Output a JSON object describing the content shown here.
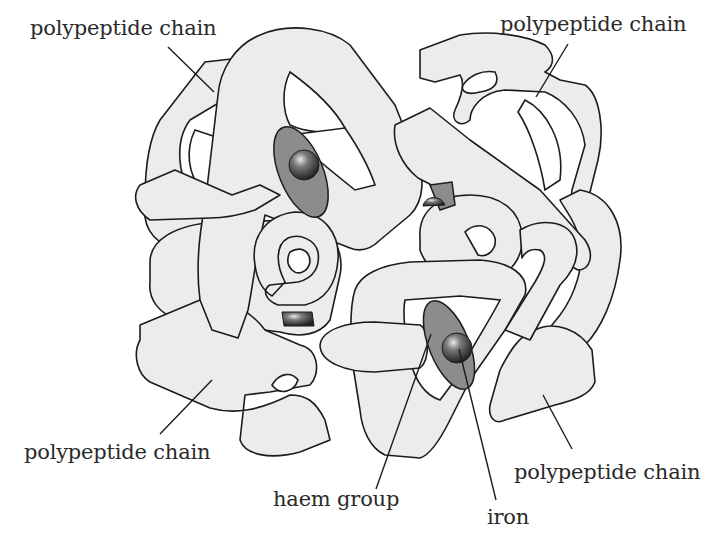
{
  "diagram": {
    "colors": {
      "polypeptide_fill": "#ececec",
      "outline": "#1c1c1c",
      "haem_fill": "#8c8c8c",
      "iron_fill": "#3a3a3a",
      "background": "#ffffff"
    },
    "labels": {
      "chain_top_left": "polypeptide chain",
      "chain_top_right": "polypeptide chain",
      "chain_bottom_left": "polypeptide chain",
      "chain_bottom_right": "polypeptide chain",
      "haem_group": "haem group",
      "iron": "iron"
    },
    "counts": {
      "polypeptide_chains": 4,
      "haem_groups": 4
    }
  }
}
